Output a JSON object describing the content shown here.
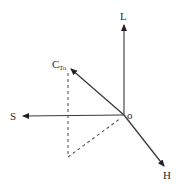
{
  "diagram": {
    "type": "3d-vector-axes",
    "colors": {
      "line": "#3a3a3a",
      "dashed": "#555555",
      "background": "#ffffff"
    },
    "origin": {
      "label": "o",
      "x": 124,
      "y": 115
    },
    "axes": [
      {
        "id": "L",
        "label": "L",
        "tip": {
          "x": 124,
          "y": 24
        }
      },
      {
        "id": "S",
        "label": "S",
        "tip": {
          "x": 22,
          "y": 116
        }
      },
      {
        "id": "H",
        "label": "H",
        "tip": {
          "x": 164,
          "y": 166
        }
      }
    ],
    "vector": {
      "label_main": "C",
      "label_sub": "To",
      "tip": {
        "x": 70,
        "y": 68
      }
    },
    "projection_lines": [
      {
        "from": {
          "x": 68,
          "y": 73
        },
        "to": {
          "x": 68,
          "y": 157
        },
        "style": "dashed"
      },
      {
        "from": {
          "x": 68,
          "y": 157
        },
        "to": {
          "x": 121,
          "y": 118
        },
        "style": "dashed"
      }
    ]
  }
}
